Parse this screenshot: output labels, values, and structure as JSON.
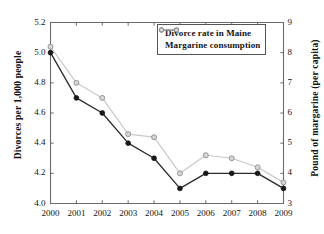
{
  "chart_data": {
    "type": "line",
    "title": "",
    "subtitle": "",
    "xlabel": "",
    "ylabel": "Divorces per 1,000 people",
    "y2label": "Pound of margarine (per capita)",
    "categories": [
      "2000",
      "2001",
      "2002",
      "2003",
      "2004",
      "2005",
      "2006",
      "2007",
      "2008",
      "2009"
    ],
    "x": [
      2000,
      2001,
      2002,
      2003,
      2004,
      2005,
      2006,
      2007,
      2008,
      2009
    ],
    "xlim": [
      2000,
      2009
    ],
    "ylim": [
      4.0,
      5.2
    ],
    "y2lim": [
      3,
      9
    ],
    "yticks": [
      "4.0",
      "4.2",
      "4.4",
      "4.6",
      "4.8",
      "5.0",
      "5.2"
    ],
    "ytick_values": [
      4.0,
      4.2,
      4.4,
      4.6,
      4.8,
      5.0,
      5.2
    ],
    "y2ticks": [
      "3",
      "4",
      "5",
      "6",
      "7",
      "8",
      "9"
    ],
    "y2tick_values": [
      3,
      4,
      5,
      6,
      7,
      8,
      9
    ],
    "grid": false,
    "legend_position": "top-right",
    "series": [
      {
        "name": "Divorce rate in Maine",
        "axis": "left",
        "color": "#222222",
        "marker": "filled-circle",
        "values": [
          5.0,
          4.7,
          4.6,
          4.4,
          4.3,
          4.1,
          4.2,
          4.2,
          4.2,
          4.1
        ]
      },
      {
        "name": "Margarine consumption",
        "axis": "right",
        "color": "#bcbcbc",
        "marker": "open-circle",
        "values": [
          8.2,
          7.0,
          6.5,
          5.3,
          5.2,
          4.0,
          4.6,
          4.5,
          4.2,
          3.7
        ]
      }
    ]
  },
  "legend": {
    "items": [
      {
        "label": "Divorce rate in Maine"
      },
      {
        "label": "Margarine consumption"
      }
    ]
  },
  "axes": {
    "left_title": "Divorces per 1,000 people",
    "right_title": "Pound of margarine (per capita)"
  }
}
